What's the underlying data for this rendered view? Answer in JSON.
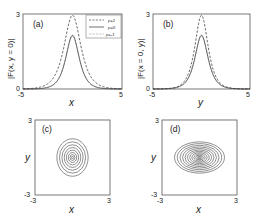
{
  "figure": {
    "width": 255,
    "height": 219,
    "background": "#ffffff",
    "line_color": "#333333"
  },
  "chart_data": [
    {
      "id": "a",
      "type": "line",
      "panel_label": "(a)",
      "xlabel": "x",
      "ylabel": "|F(x, y = 0)|",
      "xlim": [
        -5,
        5
      ],
      "ylim": [
        0,
        3
      ],
      "xticks": [
        "-5",
        "5"
      ],
      "yticks": [
        "0",
        "3"
      ],
      "grid": false,
      "legend_position": "upper right",
      "legend": [
        {
          "label": "p=1",
          "style": "dashed"
        },
        {
          "label": "p=0",
          "style": "solid"
        },
        {
          "label": "p=-1",
          "style": "dotted"
        }
      ],
      "series": [
        {
          "name": "p=1",
          "style": "dashed",
          "peak": 2.95,
          "center": 0,
          "width": 0.75
        },
        {
          "name": "p=0",
          "style": "solid",
          "peak": 2.15,
          "center": 0,
          "width": 0.6
        },
        {
          "name": "p=-1",
          "style": "dotted",
          "peak": 2.1,
          "center": 0,
          "width": 0.6
        }
      ],
      "box": {
        "left": 23,
        "top": 14,
        "right": 122,
        "bottom": 89
      }
    },
    {
      "id": "b",
      "type": "line",
      "panel_label": "(b)",
      "xlabel": "y",
      "ylabel": "|F(x = 0, y)|",
      "xlim": [
        -5,
        5
      ],
      "ylim": [
        0,
        3
      ],
      "xticks": [
        "-5",
        "5"
      ],
      "yticks": [
        "0",
        "3"
      ],
      "grid": false,
      "series": [
        {
          "name": "p=1",
          "style": "dashed",
          "peak": 2.95,
          "center": 0,
          "width": 0.6
        },
        {
          "name": "p=0",
          "style": "solid",
          "peak": 2.15,
          "center": 0,
          "width": 0.6
        },
        {
          "name": "p=-1",
          "style": "dotted",
          "peak": 2.1,
          "center": 0,
          "width": 0.6
        }
      ],
      "box": {
        "left": 153,
        "top": 14,
        "right": 250,
        "bottom": 89
      }
    },
    {
      "id": "c",
      "type": "contour",
      "panel_label": "(c)",
      "xlabel": "x",
      "ylabel": "y",
      "xlim": [
        -3,
        3
      ],
      "ylim": [
        -3,
        3
      ],
      "xticks": [
        "-3",
        "3"
      ],
      "yticks": [
        "-3",
        "3"
      ],
      "grid": false,
      "contours": {
        "center": [
          0,
          0
        ],
        "levels": 8,
        "rx_max": 1.25,
        "ry_max": 1.5
      },
      "box": {
        "left": 35,
        "top": 120,
        "right": 110,
        "bottom": 195
      }
    },
    {
      "id": "d",
      "type": "contour",
      "panel_label": "(d)",
      "xlabel": "x",
      "ylabel": "y",
      "xlim": [
        -3,
        3
      ],
      "ylim": [
        -3,
        3
      ],
      "xticks": [
        "-3",
        "3"
      ],
      "yticks": [
        "-3",
        "3"
      ],
      "grid": false,
      "contours": {
        "center": [
          0,
          0
        ],
        "levels": 12,
        "rx_max": 2.0,
        "ry_max": 1.25
      },
      "box": {
        "left": 162,
        "top": 120,
        "right": 237,
        "bottom": 195
      }
    }
  ]
}
